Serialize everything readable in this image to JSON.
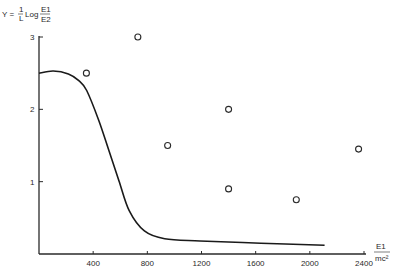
{
  "chart_data": {
    "type": "scatter",
    "title": "",
    "ylabel": {
      "prefix": "Y =",
      "frac_num": "1",
      "frac_den": "L",
      "log": "Log",
      "ratio_num": "E1",
      "ratio_den": "E2",
      "full": "Y = (1/L) Log (E1/E2)"
    },
    "xlabel": {
      "num": "E1",
      "den": "mc²",
      "full": "E1 / mc²"
    },
    "xlim": [
      0,
      2400
    ],
    "ylim": [
      0,
      3
    ],
    "x_ticks": [
      400,
      800,
      1200,
      1600,
      2000,
      2400
    ],
    "x_tick_labels": [
      "400",
      "800",
      "1200",
      "1600",
      "2000",
      "2400"
    ],
    "y_ticks": [
      1,
      2,
      3
    ],
    "y_tick_labels": [
      "1",
      "2",
      "3"
    ],
    "grid": false,
    "legend": null,
    "series": [
      {
        "name": "theoretical curve",
        "type": "line",
        "x": [
          0,
          105,
          217,
          292,
          352,
          441,
          516,
          591,
          666,
          778,
          928,
          1189,
          1638,
          2109
        ],
        "y": [
          2.5,
          2.53,
          2.49,
          2.4,
          2.26,
          1.85,
          1.43,
          1.01,
          0.6,
          0.32,
          0.21,
          0.18,
          0.15,
          0.12
        ]
      },
      {
        "name": "experimental points",
        "type": "scatter",
        "marker": "open-circle",
        "x": [
          350,
          730,
          950,
          1400,
          1400,
          1900,
          2360
        ],
        "y": [
          2.5,
          3.0,
          1.5,
          2.0,
          0.9,
          0.75,
          1.45
        ]
      }
    ]
  },
  "colors": {
    "ink": "#1a1a1a",
    "background": "#ffffff"
  }
}
